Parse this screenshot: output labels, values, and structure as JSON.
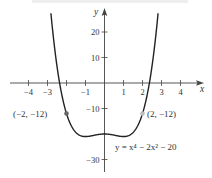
{
  "chart_data": {
    "type": "line",
    "title": "",
    "xlabel": "x",
    "ylabel": "y",
    "xlim": [
      -4.8,
      5.3
    ],
    "ylim": [
      -35,
      32
    ],
    "grid": false,
    "x_ticks": [
      -4,
      -3,
      -2,
      -1,
      1,
      2,
      3,
      4
    ],
    "x_tick_labels": [
      "−4",
      "−3",
      "",
      "−1",
      "1",
      "2",
      "3",
      "4"
    ],
    "y_ticks": [
      20,
      10,
      -10,
      -30
    ],
    "y_tick_labels": [
      "20",
      "10",
      "−10",
      "−30"
    ],
    "series": [
      {
        "name": "y = x^4 − 2x^2 − 20",
        "function": "x^4 - 2*x^2 - 20",
        "x_range": [
          -2.82,
          2.82
        ],
        "x": [
          -2.8,
          -2.5,
          -2.0,
          -1.5,
          -1.0,
          -0.5,
          0.0,
          0.5,
          1.0,
          1.5,
          2.0,
          2.5,
          2.8
        ],
        "y": [
          25.8,
          6.6,
          -12.0,
          -19.4,
          -21.0,
          -20.4,
          -20.0,
          -20.4,
          -21.0,
          -19.4,
          -12.0,
          6.6,
          25.8
        ]
      }
    ],
    "points": [
      {
        "x": -2,
        "y": -12,
        "label": "(−2, −12)",
        "color": "#666666"
      },
      {
        "x": 2,
        "y": -12,
        "label": "(2, −12)",
        "color": "#bbbbbb"
      }
    ],
    "annotations": [
      {
        "text": "y = x⁴ − 2x² − 20",
        "near": {
          "x": 0.5,
          "y": -26
        }
      }
    ],
    "legend": null
  },
  "labels": {
    "x_axis": "x",
    "y_axis": "y",
    "point_left": "(−2, −12)",
    "point_right": "(2, −12)",
    "equation": "y = x⁴ − 2x² − 20"
  },
  "colors": {
    "curve": "#222222",
    "axis": "#444444",
    "text": "#333333",
    "point_left": "#666666",
    "point_right": "#bbbbbb",
    "top_strip": "#eeeeee"
  }
}
